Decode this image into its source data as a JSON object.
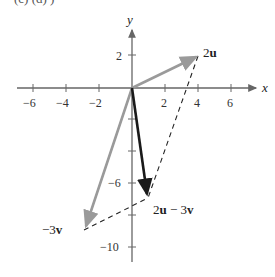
{
  "header": {
    "cropped_text": "(c)  (d)  )"
  },
  "axes": {
    "x_label": "x",
    "y_label": "y",
    "x_ticks": [
      "−6",
      "−4",
      "−2",
      "2",
      "4",
      "6"
    ],
    "y_ticks": [
      "2",
      "−6",
      "−10"
    ]
  },
  "vectors": {
    "two_u": {
      "label": "2u",
      "bold": "u",
      "prefix": "2",
      "end": [
        4,
        2
      ],
      "color": "#999999"
    },
    "neg_three_v": {
      "label": "−3v",
      "prefix": "−3",
      "bold": "v",
      "end": [
        -3,
        -9
      ],
      "color": "#999999"
    },
    "result": {
      "label": "2u − 3v",
      "end": [
        1,
        -7
      ],
      "color": "#1a1a1a"
    }
  },
  "labels": {
    "two_u_prefix": "2",
    "two_u_bold": "u",
    "neg3v_prefix": "−3",
    "neg3v_bold": "v",
    "res_prefix": "2",
    "res_u": "u",
    "res_mid": " − 3",
    "res_v": "v"
  }
}
